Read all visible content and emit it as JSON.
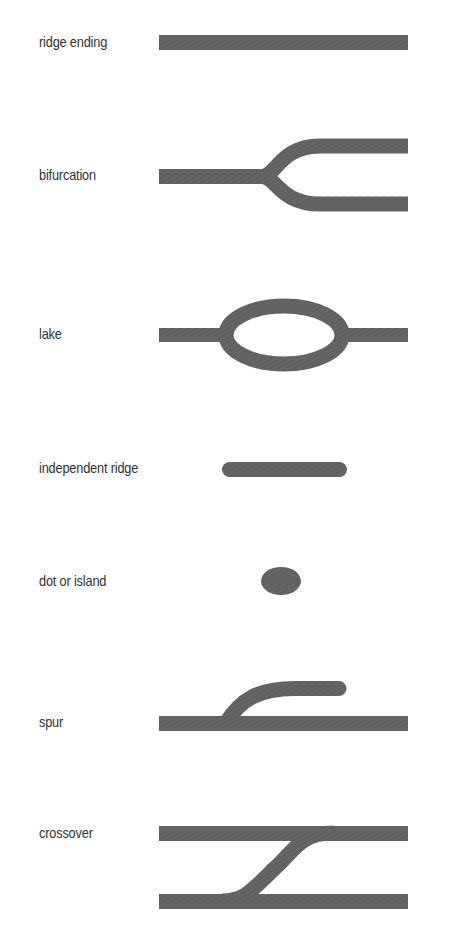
{
  "diagram": {
    "type": "fingerprint-minutiae-legend",
    "ridge_color": "#5f5f5f",
    "items": [
      {
        "label": "ridge ending",
        "shape": "straight-bar"
      },
      {
        "label": "bifurcation",
        "shape": "y-fork"
      },
      {
        "label": "lake",
        "shape": "enclosed-loop"
      },
      {
        "label": "independent ridge",
        "shape": "short-rounded-bar"
      },
      {
        "label": "dot or island",
        "shape": "small-ellipse"
      },
      {
        "label": "spur",
        "shape": "bar-with-branch"
      },
      {
        "label": "crossover",
        "shape": "two-bars-with-diagonal-bridge"
      }
    ]
  }
}
